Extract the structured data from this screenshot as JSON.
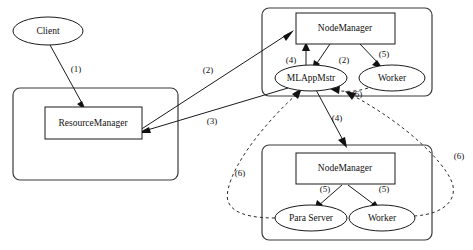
{
  "diagram": {
    "background_color": "#ffffff",
    "line_color": "#1a1a1a",
    "containers": [
      {
        "id": "rm-container",
        "name": "resource-manager-container",
        "label": ""
      },
      {
        "id": "nm1-container",
        "name": "node-manager-container-top",
        "label": ""
      },
      {
        "id": "nm2-container",
        "name": "node-manager-container-bottom",
        "label": ""
      }
    ],
    "nodes": [
      {
        "id": "client",
        "label": "Client",
        "shape": "ellipse"
      },
      {
        "id": "resourcemanager",
        "label": "ResourceManager",
        "shape": "rect"
      },
      {
        "id": "nodemanager_top",
        "label": "NodeManager",
        "shape": "rect"
      },
      {
        "id": "mlappmstr",
        "label": "MLAppMstr",
        "shape": "ellipse"
      },
      {
        "id": "worker_top",
        "label": "Worker",
        "shape": "ellipse"
      },
      {
        "id": "nodemanager_bottom",
        "label": "NodeManager",
        "shape": "rect"
      },
      {
        "id": "para_server",
        "label": "Para Server",
        "shape": "ellipse"
      },
      {
        "id": "worker_bottom",
        "label": "Worker",
        "shape": "ellipse"
      }
    ],
    "edges": [
      {
        "id": "e1",
        "label": "(1)",
        "from": "client",
        "to": "resourcemanager",
        "style": "solid"
      },
      {
        "id": "e2a",
        "label": "(2)",
        "from": "resourcemanager",
        "to": "nodemanager_top",
        "style": "solid"
      },
      {
        "id": "e2b",
        "label": "(2)",
        "from": "nodemanager_top",
        "to": "mlappmstr",
        "style": "solid"
      },
      {
        "id": "e3",
        "label": "(3)",
        "from": "mlappmstr",
        "to": "resourcemanager",
        "style": "solid"
      },
      {
        "id": "e4a",
        "label": "(4)",
        "from": "mlappmstr",
        "to": "nodemanager_top",
        "style": "solid"
      },
      {
        "id": "e4b",
        "label": "(4)",
        "from": "mlappmstr",
        "to": "nodemanager_bottom",
        "style": "solid"
      },
      {
        "id": "e5a",
        "label": "(5)",
        "from": "nodemanager_top",
        "to": "worker_top",
        "style": "solid"
      },
      {
        "id": "e5b",
        "label": "(5)",
        "from": "nodemanager_bottom",
        "to": "para_server",
        "style": "solid"
      },
      {
        "id": "e5c",
        "label": "(5)",
        "from": "nodemanager_bottom",
        "to": "worker_bottom",
        "style": "solid"
      },
      {
        "id": "e6a",
        "label": "(6)",
        "from": "para_server",
        "to": "mlappmstr",
        "style": "dashed"
      },
      {
        "id": "e6b",
        "label": "(6)",
        "from": "worker_bottom",
        "to": "mlappmstr",
        "style": "dashed"
      },
      {
        "id": "e6c",
        "label": "(6)",
        "from": "worker_top",
        "to": "mlappmstr",
        "style": "dashed"
      }
    ],
    "caption": ""
  }
}
